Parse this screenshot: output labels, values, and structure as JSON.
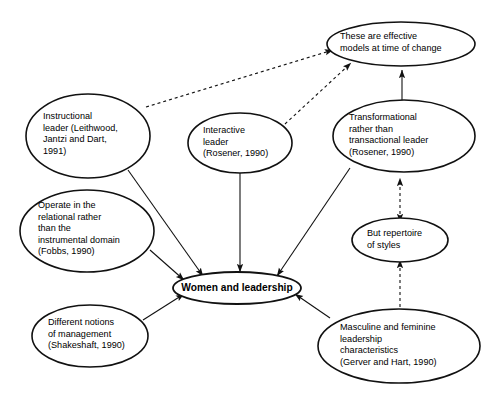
{
  "diagram": {
    "type": "concept-map",
    "background_color": "#ffffff",
    "stroke_color": "#111111",
    "nodes": [
      {
        "id": "effective-models",
        "label": "These are effective\nmodels at time of change",
        "shape": "ellipse",
        "cx": 401,
        "cy": 44,
        "rx": 74,
        "ry": 22,
        "label_x": 340,
        "label_y": 31,
        "label_width": 130,
        "bold": false
      },
      {
        "id": "instructional-leader",
        "label": "Instructional\nleader (Leithwood,\nJantzi and Dart,\n1991)",
        "shape": "ellipse",
        "cx": 88,
        "cy": 136,
        "rx": 62,
        "ry": 42,
        "label_x": 43,
        "label_y": 111,
        "label_width": 98,
        "bold": false
      },
      {
        "id": "interactive-leader",
        "label": "Interactive\nleader\n(Rosener, 1990)",
        "shape": "ellipse",
        "cx": 240,
        "cy": 143,
        "rx": 52,
        "ry": 30,
        "label_x": 203,
        "label_y": 125,
        "label_width": 82,
        "bold": false
      },
      {
        "id": "transformational-leader",
        "label": "Transformational\nrather than\ntransactional leader\n(Rosener, 1990)",
        "shape": "ellipse",
        "cx": 404,
        "cy": 136,
        "rx": 71,
        "ry": 36,
        "label_x": 349,
        "label_y": 112,
        "label_width": 112,
        "bold": false
      },
      {
        "id": "relational-domain",
        "label": "Operate in the\nrelational rather\nthan the\ninstrumental domain\n(Fobbs, 1990)",
        "shape": "ellipse",
        "cx": 87,
        "cy": 231,
        "rx": 67,
        "ry": 41,
        "label_x": 38,
        "label_y": 200,
        "label_width": 104,
        "bold": false
      },
      {
        "id": "repertoire-of-styles",
        "label": "But repertoire\nof styles",
        "shape": "ellipse",
        "cx": 400,
        "cy": 240,
        "rx": 48,
        "ry": 22,
        "label_x": 367,
        "label_y": 228,
        "label_width": 80,
        "bold": false
      },
      {
        "id": "women-and-leadership",
        "label": "Women and leadership",
        "shape": "ellipse",
        "cx": 237,
        "cy": 288,
        "rx": 64,
        "ry": 16,
        "label_x": 175,
        "label_y": 282,
        "label_width": 124,
        "bold": true
      },
      {
        "id": "different-notions",
        "label": "Different notions\nof management\n(Shakeshaft, 1990)",
        "shape": "ellipse",
        "cx": 90,
        "cy": 336,
        "rx": 58,
        "ry": 31,
        "label_x": 48,
        "label_y": 317,
        "label_width": 96,
        "bold": false
      },
      {
        "id": "masculine-feminine",
        "label": "Masculine and feminine\nleadership\ncharacteristics\n(Gerver and Hart, 1990)",
        "shape": "ellipse",
        "cx": 399,
        "cy": 346,
        "rx": 81,
        "ry": 37,
        "label_x": 340,
        "label_y": 322,
        "label_width": 134,
        "bold": false
      }
    ],
    "edges": [
      {
        "id": "instructional-to-effective",
        "from": "instructional-leader",
        "to": "effective-models",
        "style": "dashed",
        "heads": 1
      },
      {
        "id": "interactive-to-effective",
        "from": "interactive-leader",
        "to": "effective-models",
        "style": "dashed",
        "heads": 1
      },
      {
        "id": "transformational-to-effective",
        "from": "transformational-leader",
        "to": "effective-models",
        "style": "solid",
        "heads": 1
      },
      {
        "id": "instructional-to-women",
        "from": "instructional-leader",
        "to": "women-and-leadership",
        "style": "solid",
        "heads": 1
      },
      {
        "id": "interactive-to-women",
        "from": "interactive-leader",
        "to": "women-and-leadership",
        "style": "solid",
        "heads": 1
      },
      {
        "id": "transformational-to-women",
        "from": "transformational-leader",
        "to": "women-and-leadership",
        "style": "solid",
        "heads": 1
      },
      {
        "id": "relational-to-women",
        "from": "relational-domain",
        "to": "women-and-leadership",
        "style": "solid",
        "heads": 1
      },
      {
        "id": "notions-to-women",
        "from": "different-notions",
        "to": "women-and-leadership",
        "style": "solid",
        "heads": 1
      },
      {
        "id": "masculine-to-women",
        "from": "masculine-feminine",
        "to": "women-and-leadership",
        "style": "solid",
        "heads": 1
      },
      {
        "id": "repertoire-to-transformational",
        "from": "repertoire-of-styles",
        "to": "transformational-leader",
        "style": "dashed",
        "heads": 2
      },
      {
        "id": "masculine-to-repertoire",
        "from": "masculine-feminine",
        "to": "repertoire-of-styles",
        "style": "dashed",
        "heads": 2
      }
    ],
    "caption": ""
  }
}
